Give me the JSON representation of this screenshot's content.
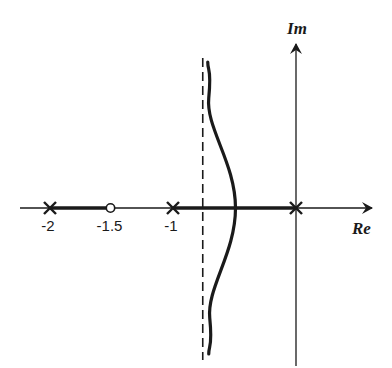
{
  "chart_data": {
    "type": "root-locus",
    "title": "",
    "axes": {
      "real_label": "Re",
      "imag_label": "Im",
      "xlim": [
        -2.4,
        0.6
      ]
    },
    "poles": [
      -2,
      -1,
      0
    ],
    "zeros": [
      -1.5
    ],
    "tick_labels": [
      {
        "value": -2,
        "text": "-2"
      },
      {
        "value": -1.5,
        "text": "-1.5"
      },
      {
        "value": -1,
        "text": "-1"
      }
    ],
    "real_axis_locus_segments": [
      [
        -2,
        -1.5
      ],
      [
        -1,
        0
      ]
    ],
    "asymptote": {
      "re": -0.75,
      "style": "dashed"
    },
    "breakaway_point": -0.5,
    "branches": [
      {
        "name": "upper-branch",
        "from": "breakaway",
        "to": "asymptote-up"
      },
      {
        "name": "lower-branch",
        "from": "breakaway",
        "to": "asymptote-down"
      }
    ],
    "colors": {
      "ink": "#1a1a1a",
      "background": "#ffffff"
    }
  }
}
